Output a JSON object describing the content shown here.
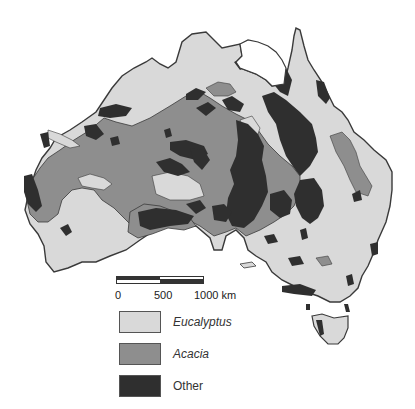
{
  "map": {
    "title": "Australia vegetation cover",
    "colors": {
      "eucalyptus": "#d9d9d9",
      "acacia": "#8e8e8e",
      "other": "#2f2f2f",
      "outline": "#3a3a3a"
    }
  },
  "scale_bar": {
    "labels": [
      "0",
      "500",
      "1000 km"
    ]
  },
  "legend": {
    "items": [
      {
        "label": "Eucalyptus",
        "italic": true,
        "color": "#d9d9d9"
      },
      {
        "label": "Acacia",
        "italic": true,
        "color": "#8e8e8e"
      },
      {
        "label": "Other",
        "italic": false,
        "color": "#2f2f2f"
      }
    ]
  }
}
